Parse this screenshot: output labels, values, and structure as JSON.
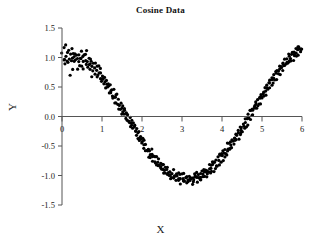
{
  "chart_data": {
    "type": "scatter",
    "title": "Cosine Data",
    "xlabel": "X",
    "ylabel": "Y",
    "xlim": [
      0,
      6
    ],
    "ylim": [
      -1.5,
      1.5
    ],
    "xticks": [
      0,
      1,
      2,
      3,
      4,
      5,
      6
    ],
    "xtick_labels": [
      "0",
      "1",
      "2",
      "3",
      "4",
      "5",
      "6"
    ],
    "yticks": [
      1.5,
      1.0,
      0.5,
      0.0,
      -0.5,
      -1.0,
      -1.5
    ],
    "ytick_labels": [
      "1.5",
      "1.0",
      "0.5",
      "0.0",
      "-0.5",
      "-1.0",
      "-1.5"
    ],
    "grid": false,
    "legend": null,
    "marker": "filled-circle",
    "marker_color": "#000000",
    "marker_size": 1.6,
    "n_points": 400,
    "x": [
      0.015,
      0.03,
      0.045,
      0.06,
      0.075,
      0.09,
      0.105,
      0.12,
      0.135,
      0.15,
      0.165,
      0.18,
      0.195,
      0.21,
      0.225,
      0.24,
      0.255,
      0.27,
      0.285,
      0.3,
      0.315,
      0.33,
      0.345,
      0.36,
      0.375,
      0.39,
      0.405,
      0.42,
      0.435,
      0.45,
      0.465,
      0.48,
      0.495,
      0.51,
      0.525,
      0.54,
      0.555,
      0.57,
      0.585,
      0.6,
      0.615,
      0.63,
      0.645,
      0.66,
      0.675,
      0.69,
      0.705,
      0.72,
      0.735,
      0.75,
      0.765,
      0.78,
      0.795,
      0.81,
      0.825,
      0.84,
      0.855,
      0.87,
      0.885,
      0.9,
      0.915,
      0.93,
      0.945,
      0.96,
      0.975,
      0.99,
      1.005,
      1.02,
      1.035,
      1.05,
      1.065,
      1.08,
      1.095,
      1.11,
      1.125,
      1.14,
      1.155,
      1.17,
      1.185,
      1.2,
      1.215,
      1.23,
      1.245,
      1.26,
      1.275,
      1.29,
      1.305,
      1.32,
      1.335,
      1.35,
      1.365,
      1.38,
      1.395,
      1.41,
      1.425,
      1.44,
      1.455,
      1.47,
      1.485,
      1.5,
      1.515,
      1.53,
      1.545,
      1.56,
      1.575,
      1.59,
      1.605,
      1.62,
      1.635,
      1.65,
      1.665,
      1.68,
      1.695,
      1.71,
      1.725,
      1.74,
      1.755,
      1.77,
      1.785,
      1.8,
      1.815,
      1.83,
      1.845,
      1.86,
      1.875,
      1.89,
      1.905,
      1.92,
      1.935,
      1.95,
      1.965,
      1.98,
      1.995,
      2.01,
      2.025,
      2.04,
      2.055,
      2.07,
      2.085,
      2.1,
      2.115,
      2.13,
      2.145,
      2.16,
      2.175,
      2.19,
      2.205,
      2.22,
      2.235,
      2.25,
      2.265,
      2.28,
      2.295,
      2.31,
      2.325,
      2.34,
      2.355,
      2.37,
      2.385,
      2.4,
      2.415,
      2.43,
      2.445,
      2.46,
      2.475,
      2.49,
      2.505,
      2.52,
      2.535,
      2.55,
      2.565,
      2.58,
      2.595,
      2.61,
      2.625,
      2.64,
      2.655,
      2.67,
      2.685,
      2.7,
      2.715,
      2.73,
      2.745,
      2.76,
      2.775,
      2.79,
      2.805,
      2.82,
      2.835,
      2.85,
      2.865,
      2.88,
      2.895,
      2.91,
      2.925,
      2.94,
      2.955,
      2.97,
      2.985,
      3.0,
      3.015,
      3.03,
      3.045,
      3.06,
      3.075,
      3.09,
      3.105,
      3.12,
      3.135,
      3.15,
      3.165,
      3.18,
      3.195,
      3.21,
      3.225,
      3.24,
      3.255,
      3.27,
      3.285,
      3.3,
      3.315,
      3.33,
      3.345,
      3.36,
      3.375,
      3.39,
      3.405,
      3.42,
      3.435,
      3.45,
      3.465,
      3.48,
      3.495,
      3.51,
      3.525,
      3.54,
      3.555,
      3.57,
      3.585,
      3.6,
      3.615,
      3.63,
      3.645,
      3.66,
      3.675,
      3.69,
      3.705,
      3.72,
      3.735,
      3.75,
      3.765,
      3.78,
      3.795,
      3.81,
      3.825,
      3.84,
      3.855,
      3.87,
      3.885,
      3.9,
      3.915,
      3.93,
      3.945,
      3.96,
      3.975,
      3.99,
      4.005,
      4.02,
      4.035,
      4.05,
      4.065,
      4.08,
      4.095,
      4.11,
      4.125,
      4.14,
      4.155,
      4.17,
      4.185,
      4.2,
      4.215,
      4.23,
      4.245,
      4.26,
      4.275,
      4.29,
      4.305,
      4.32,
      4.335,
      4.35,
      4.365,
      4.38,
      4.395,
      4.41,
      4.425,
      4.44,
      4.455,
      4.47,
      4.485,
      4.5,
      4.515,
      4.53,
      4.545,
      4.56,
      4.575,
      4.59,
      4.605,
      4.62,
      4.635,
      4.65,
      4.665,
      4.68,
      4.695,
      4.71,
      4.725,
      4.74,
      4.755,
      4.77,
      4.785,
      4.8,
      4.815,
      4.83,
      4.845,
      4.86,
      4.875,
      4.89,
      4.905,
      4.92,
      4.935,
      4.95,
      4.965,
      4.98,
      4.995,
      5.01,
      5.025,
      5.04,
      5.055,
      5.07,
      5.085,
      5.1,
      5.115,
      5.13,
      5.145,
      5.16,
      5.175,
      5.19,
      5.205,
      5.22,
      5.235,
      5.25,
      5.265,
      5.28,
      5.295,
      5.31,
      5.325,
      5.34,
      5.355,
      5.37,
      5.385,
      5.4,
      5.415,
      5.43,
      5.445,
      5.46,
      5.475,
      5.49,
      5.505,
      5.52,
      5.535,
      5.55,
      5.565,
      5.58,
      5.595,
      5.61,
      5.625,
      5.64,
      5.655,
      5.67,
      5.685,
      5.7,
      5.715,
      5.73,
      5.745,
      5.76,
      5.775,
      5.79,
      5.805,
      5.82,
      5.835,
      5.85,
      5.865,
      5.88,
      5.895,
      5.91,
      5.925,
      5.94,
      5.955,
      5.97,
      5.985,
      6.0
    ],
    "y": [
      1.06,
      0.93,
      1.14,
      0.98,
      0.88,
      1.19,
      1.02,
      0.95,
      1.09,
      0.86,
      1.12,
      0.99,
      0.72,
      1.05,
      0.91,
      1.16,
      0.97,
      0.84,
      1.07,
      1.0,
      0.9,
      1.11,
      0.95,
      1.03,
      0.82,
      0.98,
      1.08,
      0.93,
      0.87,
      1.02,
      0.96,
      1.1,
      0.85,
      0.99,
      0.92,
      1.04,
      0.78,
      0.95,
      1.07,
      0.89,
      1.12,
      0.93,
      0.84,
      1.0,
      0.9,
      0.97,
      0.8,
      0.88,
      0.95,
      0.74,
      0.86,
      0.79,
      0.92,
      0.83,
      0.7,
      0.88,
      0.76,
      0.81,
      0.67,
      0.75,
      0.84,
      0.72,
      0.65,
      0.78,
      0.7,
      0.6,
      0.73,
      0.62,
      0.68,
      0.55,
      0.64,
      0.58,
      0.5,
      0.61,
      0.53,
      0.46,
      0.56,
      0.48,
      0.41,
      0.52,
      0.44,
      0.37,
      0.47,
      0.39,
      0.32,
      0.43,
      0.35,
      0.28,
      0.38,
      0.3,
      0.23,
      0.33,
      0.25,
      0.18,
      0.28,
      0.2,
      0.13,
      0.23,
      0.15,
      0.08,
      0.18,
      0.1,
      0.03,
      0.13,
      0.05,
      -0.02,
      0.08,
      0.0,
      -0.07,
      0.03,
      -0.05,
      -0.12,
      -0.02,
      -0.1,
      -0.17,
      -0.07,
      -0.15,
      -0.22,
      -0.12,
      -0.2,
      -0.27,
      -0.17,
      -0.25,
      -0.32,
      -0.22,
      -0.3,
      -0.37,
      -0.27,
      -0.35,
      -0.42,
      -0.32,
      -0.4,
      -0.47,
      -0.37,
      -0.45,
      -0.52,
      -0.42,
      -0.5,
      -0.57,
      -0.47,
      -0.55,
      -0.62,
      -0.52,
      -0.6,
      -0.66,
      -0.56,
      -0.64,
      -0.7,
      -0.6,
      -0.68,
      -0.74,
      -0.64,
      -0.72,
      -0.78,
      -0.68,
      -0.75,
      -0.82,
      -0.71,
      -0.79,
      -0.85,
      -0.75,
      -0.82,
      -0.88,
      -0.78,
      -0.85,
      -0.91,
      -0.81,
      -0.88,
      -0.94,
      -0.84,
      -0.9,
      -0.96,
      -0.86,
      -0.93,
      -0.99,
      -0.88,
      -0.95,
      -1.01,
      -0.9,
      -0.97,
      -1.03,
      -0.92,
      -0.99,
      -1.05,
      -0.94,
      -1.0,
      -1.06,
      -0.95,
      -1.02,
      -1.08,
      -0.96,
      -1.03,
      -1.09,
      -0.97,
      -1.04,
      -1.1,
      -0.98,
      -1.05,
      -1.11,
      -0.99,
      -1.05,
      -1.11,
      -0.99,
      -1.06,
      -1.12,
      -1.0,
      -1.06,
      -1.12,
      -1.0,
      -1.06,
      -1.12,
      -1.0,
      -1.05,
      -1.11,
      -0.99,
      -1.05,
      -1.11,
      -0.99,
      -1.04,
      -1.1,
      -0.98,
      -1.03,
      -1.09,
      -0.97,
      -1.02,
      -1.08,
      -0.96,
      -1.01,
      -1.07,
      -0.95,
      -1.0,
      -1.05,
      -0.93,
      -0.98,
      -1.04,
      -0.91,
      -0.96,
      -1.02,
      -0.89,
      -0.94,
      -1.0,
      -0.87,
      -0.92,
      -0.98,
      -0.85,
      -0.9,
      -0.95,
      -0.82,
      -0.87,
      -0.93,
      -0.8,
      -0.84,
      -0.9,
      -0.77,
      -0.81,
      -0.87,
      -0.74,
      -0.78,
      -0.84,
      -0.7,
      -0.75,
      -0.81,
      -0.67,
      -0.71,
      -0.77,
      -0.64,
      -0.68,
      -0.73,
      -0.6,
      -0.64,
      -0.7,
      -0.56,
      -0.6,
      -0.66,
      -0.52,
      -0.56,
      -0.62,
      -0.48,
      -0.52,
      -0.58,
      -0.44,
      -0.48,
      -0.53,
      -0.4,
      -0.43,
      -0.49,
      -0.35,
      -0.39,
      -0.44,
      -0.31,
      -0.34,
      -0.4,
      -0.26,
      -0.3,
      -0.35,
      -0.21,
      -0.25,
      -0.3,
      -0.17,
      -0.2,
      -0.26,
      -0.12,
      -0.15,
      -0.21,
      -0.07,
      -0.1,
      -0.16,
      -0.02,
      -0.05,
      -0.11,
      0.03,
      0.0,
      -0.06,
      0.08,
      0.05,
      -0.01,
      0.13,
      0.1,
      0.04,
      0.18,
      0.15,
      0.09,
      0.23,
      0.2,
      0.14,
      0.28,
      0.25,
      0.19,
      0.33,
      0.3,
      0.24,
      0.38,
      0.35,
      0.29,
      0.43,
      0.4,
      0.34,
      0.48,
      0.45,
      0.39,
      0.53,
      0.5,
      0.44,
      0.57,
      0.55,
      0.49,
      0.62,
      0.59,
      0.54,
      0.66,
      0.64,
      0.58,
      0.71,
      0.68,
      0.63,
      0.75,
      0.72,
      0.67,
      0.79,
      0.77,
      0.71,
      0.83,
      0.81,
      0.75,
      0.87,
      0.85,
      0.79,
      0.9,
      0.88,
      0.83,
      0.94,
      0.92,
      0.86,
      0.97,
      0.95,
      0.9,
      1.0,
      0.98,
      0.93,
      1.03,
      1.01,
      0.96,
      1.06,
      1.04,
      0.99,
      1.08,
      1.07,
      1.02,
      1.11,
      1.09,
      1.04,
      1.13,
      1.12,
      1.07,
      1.15,
      1.14,
      1.09,
      1.17,
      1.16,
      1.11,
      1.18
    ]
  },
  "axes": {
    "x_axis_name": "x-axis",
    "y_axis_name": "y-axis"
  }
}
